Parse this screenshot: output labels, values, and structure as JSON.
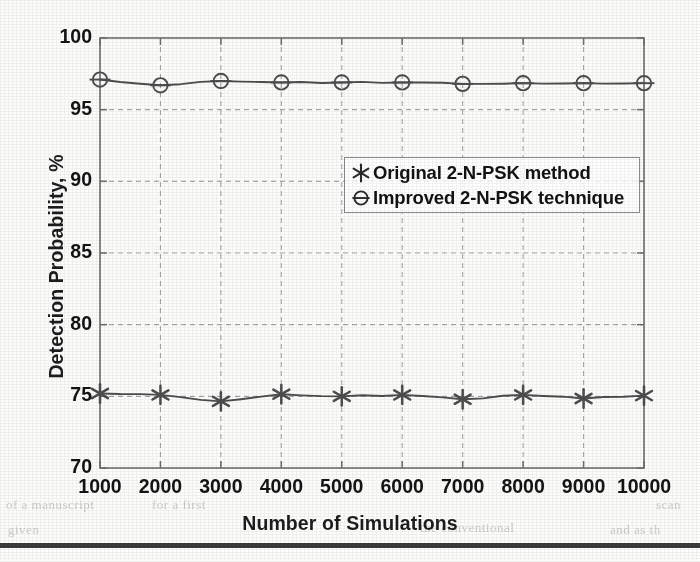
{
  "figure": {
    "background_color": "#fdfdfc",
    "plot_border_color": "#6f6f6f",
    "grid_color": "#a9a9a9",
    "series_color": "#4d4d4d",
    "text_color": "#141414",
    "bottom_rule_color": "#3b3b3b"
  },
  "chart_data": {
    "type": "line",
    "title": "",
    "xlabel": "Number of Simulations",
    "ylabel": "Detection Probability, %",
    "x": [
      1000,
      2000,
      3000,
      4000,
      5000,
      6000,
      7000,
      8000,
      9000,
      10000
    ],
    "xtick_labels": [
      "1000",
      "2000",
      "3000",
      "4000",
      "5000",
      "6000",
      "7000",
      "8000",
      "9000",
      "10000"
    ],
    "ytick_labels": [
      "70",
      "75",
      "80",
      "85",
      "90",
      "95",
      "100"
    ],
    "yticks": [
      70,
      75,
      80,
      85,
      90,
      95,
      100
    ],
    "xlim": [
      1000,
      10000
    ],
    "ylim": [
      70,
      100
    ],
    "grid": true,
    "grid_style": "dashed",
    "legend_position": "center-right",
    "series": [
      {
        "name": "Original 2-N-PSK method",
        "marker": "star-asterisk",
        "marker_name": "asterisk-marker",
        "color": "#4d4d4d",
        "values": [
          75.2,
          75.1,
          74.65,
          75.15,
          75.0,
          75.1,
          74.8,
          75.1,
          74.85,
          75.05
        ]
      },
      {
        "name": "Improved 2-N-PSK technique",
        "marker": "circle-with-horizontal-line",
        "marker_name": "circle-line-marker",
        "color": "#4d4d4d",
        "values": [
          97.1,
          96.7,
          97.0,
          96.9,
          96.9,
          96.9,
          96.8,
          96.85,
          96.85,
          96.85
        ]
      }
    ]
  },
  "legend": {
    "entries": [
      {
        "label": "Original 2-N-PSK method",
        "marker": "asterisk-marker"
      },
      {
        "label": "Improved 2-N-PSK technique",
        "marker": "circle-line-marker"
      }
    ]
  },
  "artifacts": {
    "bleed_left": "of a manuscript",
    "bleed_mid": "for a first",
    "bleed_right": "scan",
    "bleed_low_left": "given",
    "bleed_low_mid": "the  conventional",
    "bleed_low_right": "and  as  th"
  }
}
